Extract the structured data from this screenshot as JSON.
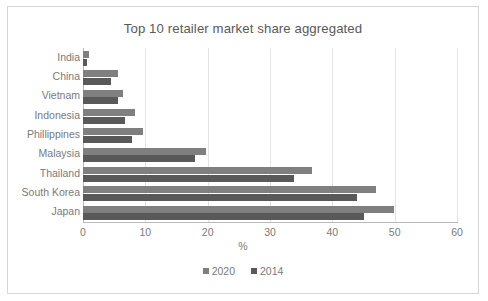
{
  "chart_data": {
    "type": "bar",
    "orientation": "horizontal",
    "title": "Top 10 retailer market share aggregated",
    "xlabel": "%",
    "ylabel": "",
    "xlim": [
      0,
      60
    ],
    "xticks": [
      0,
      10,
      20,
      30,
      40,
      50,
      60
    ],
    "xtick_labels": [
      "0",
      "10",
      "20",
      "30",
      "40",
      "50",
      "60"
    ],
    "grid": true,
    "legend_position": "bottom",
    "categories": [
      "India",
      "China",
      "Vietnam",
      "Indonesia",
      "Phillippines",
      "Malaysia",
      "Thailand",
      "South Korea",
      "Japan"
    ],
    "series": [
      {
        "name": "2020",
        "color": "#7f7f7f",
        "values": [
          1.0,
          5.6,
          6.4,
          8.4,
          9.7,
          19.8,
          36.8,
          47.0,
          49.9
        ]
      },
      {
        "name": "2014",
        "color": "#595959",
        "values": [
          0.7,
          4.5,
          5.6,
          6.8,
          7.8,
          17.9,
          33.9,
          44.0,
          45.1
        ]
      }
    ]
  },
  "legend": {
    "items": [
      {
        "label": "2020",
        "color": "#7f7f7f"
      },
      {
        "label": "2014",
        "color": "#595959"
      }
    ]
  },
  "colors": {
    "series_2020": "#7f7f7f",
    "series_2014": "#595959",
    "grid": "#e3e3e3",
    "axis": "#b8b8b8",
    "text": "#7a7a7a",
    "title_text": "#595959",
    "frame": "#d6d6d6",
    "background": "#ffffff"
  }
}
